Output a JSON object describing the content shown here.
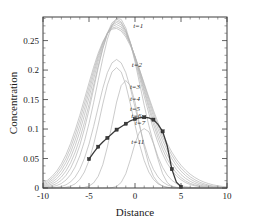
{
  "chart_data": {
    "type": "line",
    "title": "",
    "xlabel": "Distance",
    "ylabel": "Concentration",
    "xlim": [
      -10,
      10
    ],
    "ylim": [
      0,
      0.29
    ],
    "xticks": [
      -10,
      -5,
      0,
      5,
      10
    ],
    "xtick_labels": [
      "-10",
      "-5",
      "0",
      "5",
      "10"
    ],
    "yticks": [
      0,
      0.05,
      0.1,
      0.15,
      0.2,
      0.25
    ],
    "ytick_labels": [
      "0",
      "0.05",
      "0.1",
      "0.15",
      "0.2",
      "0.25"
    ],
    "grid": false,
    "legend": "inline-annotations",
    "x": [
      -10,
      -9.5,
      -9,
      -8.5,
      -8,
      -7.5,
      -7,
      -6.5,
      -6,
      -5.5,
      -5,
      -4.5,
      -4,
      -3.5,
      -3,
      -2.5,
      -2,
      -1.5,
      -1,
      -0.5,
      0,
      0.5,
      1,
      1.5,
      2,
      2.5,
      3,
      3.5,
      4,
      4.5,
      5,
      5.5,
      6,
      6.5,
      7,
      7.5,
      8,
      8.5,
      9,
      9.5,
      10
    ],
    "series": [
      {
        "name": "t=1",
        "label": "t=1",
        "color": "#b4b4b4",
        "label_x": 0.35,
        "label_y": 0.272,
        "values": [
          0.0,
          0.0,
          0.0,
          0.0,
          0.0,
          0.0,
          0.0,
          0.0,
          0.0,
          0.0,
          0.0,
          0.0,
          0.0,
          0.0,
          0.0001,
          0.0006,
          0.0027,
          0.0094,
          0.0242,
          0.0484,
          0.0756,
          0.0955,
          0.1007,
          0.0955,
          0.0756,
          0.0484,
          0.0242,
          0.0094,
          0.0027,
          0.0006,
          0.0001,
          0.0,
          0.0,
          0.0,
          0.0,
          0.0,
          0.0,
          0.0,
          0.0,
          0.0,
          0.0
        ]
      },
      {
        "name": "t=2",
        "label": "t=2",
        "color": "#b4b4b4",
        "label_x": 0.2,
        "label_y": 0.205,
        "values": [
          0.0,
          0.0,
          0.0,
          0.0,
          0.0,
          0.0,
          0.0,
          0.0001,
          0.0003,
          0.0011,
          0.0033,
          0.0086,
          0.0198,
          0.0396,
          0.0696,
          0.1074,
          0.1457,
          0.1738,
          0.1823,
          0.1738,
          0.1457,
          0.1074,
          0.0696,
          0.0396,
          0.0198,
          0.0086,
          0.0033,
          0.0011,
          0.0003,
          0.0001,
          0.0,
          0.0,
          0.0,
          0.0,
          0.0,
          0.0,
          0.0,
          0.0,
          0.0,
          0.0,
          0.0
        ]
      },
      {
        "name": "t=3",
        "label": "t=3",
        "color": "#b4b4b4",
        "label_x": 0.0,
        "label_y": 0.168,
        "values": [
          0.0,
          0.0,
          0.0001,
          0.0002,
          0.0005,
          0.0013,
          0.0032,
          0.0071,
          0.0145,
          0.0271,
          0.0466,
          0.0736,
          0.1068,
          0.1425,
          0.1748,
          0.1969,
          0.2042,
          0.1969,
          0.1748,
          0.1425,
          0.1068,
          0.0736,
          0.0466,
          0.0271,
          0.0145,
          0.0071,
          0.0032,
          0.0013,
          0.0005,
          0.0002,
          0.0001,
          0.0,
          0.0,
          0.0,
          0.0,
          0.0,
          0.0,
          0.0,
          0.0,
          0.0,
          0.0
        ]
      },
      {
        "name": "t=4",
        "label": "t=4",
        "color": "#b4b4b4",
        "label_x": 0.0,
        "label_y": 0.148,
        "values": [
          0.0001,
          0.0002,
          0.0005,
          0.0012,
          0.0026,
          0.0054,
          0.0104,
          0.0187,
          0.0316,
          0.0501,
          0.0746,
          0.1043,
          0.137,
          0.1691,
          0.1956,
          0.2122,
          0.218,
          0.2122,
          0.1956,
          0.1691,
          0.137,
          0.1043,
          0.0746,
          0.0501,
          0.0316,
          0.0187,
          0.0104,
          0.0054,
          0.0026,
          0.0012,
          0.0005,
          0.0002,
          0.0001,
          0.0,
          0.0,
          0.0,
          0.0,
          0.0,
          0.0,
          0.0,
          0.0
        ]
      },
      {
        "name": "t=5",
        "label": "t=5",
        "color": "#b4b4b4",
        "label_x": 0.0,
        "label_y": 0.131,
        "values": [
          0.0005,
          0.0011,
          0.0022,
          0.0042,
          0.0077,
          0.0135,
          0.0225,
          0.0358,
          0.0544,
          0.079,
          0.1094,
          0.1446,
          0.1826,
          0.2199,
          0.2523,
          0.276,
          0.2877,
          0.286,
          0.2715,
          0.2465,
          0.214,
          0.1774,
          0.1404,
          0.1062,
          0.0766,
          0.0529,
          0.0349,
          0.0219,
          0.0132,
          0.0076,
          0.0042,
          0.0022,
          0.0011,
          0.0005,
          0.0002,
          0.0001,
          0.0,
          0.0,
          0.0,
          0.0,
          0.0
        ]
      },
      {
        "name": "t=6",
        "label": "t=6",
        "color": "#b4b4b4",
        "label_x": 0.15,
        "label_y": 0.118,
        "values": [
          0.0012,
          0.0023,
          0.0043,
          0.0077,
          0.0131,
          0.0214,
          0.0335,
          0.0503,
          0.0724,
          0.1,
          0.1325,
          0.1679,
          0.2038,
          0.2365,
          0.2629,
          0.2801,
          0.2865,
          0.2818,
          0.2672,
          0.2448,
          0.2171,
          0.1867,
          0.1559,
          0.1266,
          0.1,
          0.0769,
          0.0576,
          0.042,
          0.0299,
          0.0207,
          0.014,
          0.0092,
          0.0059,
          0.0037,
          0.0023,
          0.0014,
          0.0008,
          0.0005,
          0.0003,
          0.0002,
          0.0001
        ]
      },
      {
        "name": "t=7",
        "label": "t=7",
        "color": "#b4b4b4",
        "label_x": 0.55,
        "label_y": 0.106,
        "values": [
          0.0023,
          0.0041,
          0.007,
          0.0117,
          0.0187,
          0.0288,
          0.0427,
          0.0609,
          0.0837,
          0.1109,
          0.1417,
          0.1745,
          0.207,
          0.2367,
          0.2608,
          0.2769,
          0.2833,
          0.2797,
          0.2668,
          0.2464,
          0.2208,
          0.1923,
          0.1631,
          0.1348,
          0.1086,
          0.0853,
          0.0654,
          0.0489,
          0.0357,
          0.0254,
          0.0177,
          0.012,
          0.0079,
          0.0051,
          0.0032,
          0.002,
          0.0012,
          0.0007,
          0.0004,
          0.0002,
          0.0001
        ]
      },
      {
        "name": "t=8",
        "label": "",
        "color": "#b4b4b4",
        "label_x": null,
        "label_y": null,
        "values": [
          0.0036,
          0.0061,
          0.01,
          0.0159,
          0.0244,
          0.0362,
          0.0518,
          0.0716,
          0.0956,
          0.1232,
          0.1534,
          0.1846,
          0.2147,
          0.2414,
          0.2624,
          0.2758,
          0.2806,
          0.2766,
          0.2645,
          0.2456,
          0.2218,
          0.1951,
          0.1674,
          0.1403,
          0.115,
          0.0925,
          0.0729,
          0.0563,
          0.0426,
          0.0315,
          0.0229,
          0.0163,
          0.0113,
          0.0077,
          0.0051,
          0.0034,
          0.0022,
          0.0013,
          0.0008,
          0.0005,
          0.0003
        ]
      },
      {
        "name": "t=9",
        "label": "",
        "color": "#b4b4b4",
        "label_x": null,
        "label_y": null,
        "values": [
          0.0052,
          0.0084,
          0.0133,
          0.0203,
          0.0302,
          0.0434,
          0.0604,
          0.0813,
          0.1058,
          0.1334,
          0.1629,
          0.1926,
          0.2206,
          0.2447,
          0.2628,
          0.2737,
          0.2772,
          0.2731,
          0.262,
          0.2447,
          0.2228,
          0.1979,
          0.1718,
          0.1461,
          0.1219,
          0.1,
          0.0806,
          0.0639,
          0.0498,
          0.0381,
          0.0286,
          0.0211,
          0.0152,
          0.0108,
          0.0075,
          0.0051,
          0.0034,
          0.0022,
          0.0014,
          0.0009,
          0.0006
        ]
      },
      {
        "name": "t=10",
        "label": "",
        "color": "#b4b4b4",
        "label_x": null,
        "label_y": null,
        "values": [
          0.0069,
          0.0108,
          0.0166,
          0.0247,
          0.0358,
          0.0502,
          0.0684,
          0.0902,
          0.1152,
          0.1426,
          0.171,
          0.199,
          0.2248,
          0.2464,
          0.2622,
          0.2712,
          0.2734,
          0.2695,
          0.2592,
          0.2436,
          0.2235,
          0.2003,
          0.1756,
          0.151,
          0.1275,
          0.106,
          0.0868,
          0.0701,
          0.0558,
          0.0437,
          0.0337,
          0.0256,
          0.0191,
          0.014,
          0.0101,
          0.0071,
          0.0049,
          0.0033,
          0.0022,
          0.0015,
          0.001
        ]
      },
      {
        "name": "t=11",
        "label": "t=11",
        "color": "#b4b4b4",
        "label_x": 0.3,
        "label_y": 0.075,
        "values": [
          0.0088,
          0.0133,
          0.0199,
          0.0289,
          0.041,
          0.0565,
          0.0756,
          0.0981,
          0.1234,
          0.1506,
          0.1782,
          0.2048,
          0.2287,
          0.2482,
          0.262,
          0.2694,
          0.2706,
          0.2663,
          0.2561,
          0.2411,
          0.2222,
          0.2006,
          0.1775,
          0.1543,
          0.1319,
          0.111,
          0.0921,
          0.0754,
          0.061,
          0.0488,
          0.0386,
          0.0302,
          0.0234,
          0.0179,
          0.0135,
          0.01,
          0.0074,
          0.0053,
          0.0038,
          0.0027,
          0.0019
        ]
      }
    ],
    "highlight_series": {
      "name": "numerical-solution",
      "color": "#3a3a3a",
      "marker": "square",
      "marker_x": [
        -5,
        -4,
        -3,
        -2,
        -1,
        0,
        1,
        2,
        3,
        4,
        5
      ],
      "marker_y": [
        0.049,
        0.07,
        0.085,
        0.099,
        0.109,
        0.117,
        0.12,
        0.116,
        0.096,
        0.032,
        0.002
      ],
      "values_x": [
        -5,
        -4.5,
        -4,
        -3.5,
        -3,
        -2.5,
        -2,
        -1.5,
        -1,
        -0.5,
        0,
        0.5,
        1,
        1.5,
        2,
        2.5,
        3,
        3.5,
        4,
        4.5,
        5
      ],
      "values_y": [
        0.049,
        0.06,
        0.07,
        0.078,
        0.085,
        0.092,
        0.099,
        0.104,
        0.109,
        0.114,
        0.117,
        0.119,
        0.12,
        0.119,
        0.116,
        0.108,
        0.096,
        0.072,
        0.032,
        0.01,
        0.002
      ]
    }
  },
  "axes": {
    "xlabel": "Distance",
    "ylabel": "Concentration"
  }
}
